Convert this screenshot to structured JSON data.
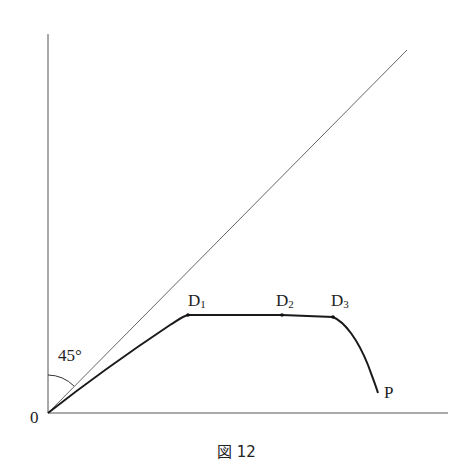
{
  "figure": {
    "caption": "図 12",
    "origin_label": "0",
    "angle_label": "45°",
    "end_label": "P",
    "points": [
      {
        "label": "D",
        "sub": "1"
      },
      {
        "label": "D",
        "sub": "2"
      },
      {
        "label": "D",
        "sub": "3"
      }
    ]
  },
  "colors": {
    "axis": "#333333",
    "diagonal": "#555555",
    "curve": "#1a1a1a"
  }
}
